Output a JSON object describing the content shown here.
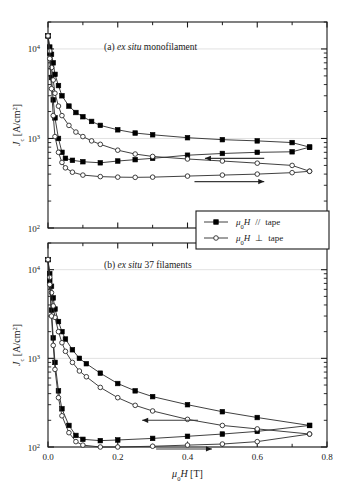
{
  "figure": {
    "xlabel_mu": "μ",
    "xlabel_sub": "0",
    "xlabel_H": "H",
    "xlabel_unit": " [T]",
    "ylabel_J": "J",
    "ylabel_sub": "c",
    "ylabel_unit": " [A/cm",
    "ylabel_sup": "2",
    "ylabel_close": "]",
    "xticks": [
      "0.0",
      "0.2",
      "0.4",
      "0.6",
      "0.8"
    ],
    "xtick_values": [
      0.0,
      0.2,
      0.4,
      0.6,
      0.8
    ],
    "xlim": [
      0.0,
      0.8
    ],
    "yticks_mantissa": [
      "10",
      "10",
      "10"
    ],
    "yticks_exponent": [
      "4",
      "3",
      "2"
    ],
    "ylim": [
      100,
      20000
    ],
    "panel_a_label_prefix": "(a) ",
    "panel_a_label_italic": "ex situ",
    "panel_a_label_suffix": " monofilament",
    "panel_b_label_prefix": "(b) ",
    "panel_b_label_italic": "ex situ",
    "panel_b_label_suffix": " 37 filaments"
  },
  "legend": {
    "entries": [
      {
        "marker": "filled-square",
        "mu": "μ",
        "sub": "0",
        "H": "H",
        "orient": "//",
        "tape": "tape"
      },
      {
        "marker": "open-circle",
        "mu": "μ",
        "sub": "0",
        "H": "H",
        "orient": "⊥",
        "tape": "tape"
      }
    ]
  },
  "colors": {
    "line": "#2b2b2b",
    "axis": "#1a1a1a",
    "grid": "#d9d9d9",
    "marker_fill": "#000000",
    "marker_open": "#ffffff",
    "background": "#ffffff"
  },
  "chart_data": {
    "type": "line",
    "title": "",
    "xlabel": "mu0 H [T]",
    "ylabel": "Jc [A/cm^2]",
    "xlim": [
      0.0,
      0.8
    ],
    "ylim": [
      100,
      20000
    ],
    "yscale": "log",
    "xscale": "linear",
    "grid": true,
    "legend_position": "inside-between-panels",
    "panels": [
      {
        "id": "a",
        "label": "(a) ex situ monofilament",
        "ylim": [
          100,
          20000
        ],
        "series": [
          {
            "name": "mu0H // tape, decreasing field (upper branch)",
            "marker": "filled-square",
            "branch": "decreasing",
            "x": [
              0.0,
              0.005,
              0.01,
              0.015,
              0.02,
              0.03,
              0.04,
              0.06,
              0.08,
              0.1,
              0.125,
              0.15,
              0.2,
              0.25,
              0.3,
              0.4,
              0.5,
              0.6,
              0.7,
              0.75
            ],
            "y": [
              14000,
              10500,
              8700,
              7000,
              5200,
              3900,
              3000,
              2300,
              1950,
              1750,
              1550,
              1400,
              1250,
              1150,
              1100,
              1020,
              970,
              940,
              900,
              800
            ]
          },
          {
            "name": "mu0H // tape, increasing field (lower branch)",
            "marker": "filled-square",
            "branch": "increasing",
            "x": [
              0.0,
              0.005,
              0.01,
              0.015,
              0.02,
              0.03,
              0.04,
              0.05,
              0.07,
              0.1,
              0.15,
              0.2,
              0.25,
              0.3,
              0.4,
              0.5,
              0.6,
              0.7,
              0.75
            ],
            "y": [
              14000,
              9000,
              4800,
              2700,
              1700,
              1000,
              700,
              600,
              570,
              550,
              535,
              560,
              580,
              600,
              650,
              680,
              700,
              710,
              800
            ]
          },
          {
            "name": "mu0H perp tape, decreasing field (upper branch)",
            "marker": "open-circle",
            "branch": "decreasing",
            "x": [
              0.0,
              0.005,
              0.01,
              0.015,
              0.02,
              0.03,
              0.04,
              0.06,
              0.08,
              0.1,
              0.125,
              0.15,
              0.2,
              0.25,
              0.3,
              0.4,
              0.5,
              0.6,
              0.7,
              0.75
            ],
            "y": [
              14000,
              9500,
              6200,
              4500,
              3200,
              2300,
              1800,
              1400,
              1180,
              1050,
              940,
              860,
              740,
              670,
              630,
              590,
              560,
              530,
              500,
              430
            ]
          },
          {
            "name": "mu0H perp tape, increasing field (lower branch)",
            "marker": "open-circle",
            "branch": "increasing",
            "x": [
              0.0,
              0.005,
              0.01,
              0.015,
              0.02,
              0.03,
              0.04,
              0.05,
              0.07,
              0.1,
              0.15,
              0.2,
              0.25,
              0.3,
              0.4,
              0.5,
              0.6,
              0.7,
              0.75
            ],
            "y": [
              14000,
              7800,
              3600,
              1800,
              1050,
              700,
              540,
              470,
              420,
              390,
              375,
              370,
              368,
              370,
              380,
              390,
              400,
              415,
              430
            ]
          }
        ],
        "annotations": [
          {
            "type": "arrow",
            "direction": "left",
            "x_from": 0.62,
            "x_to": 0.45,
            "y": 600
          },
          {
            "type": "arrow",
            "direction": "right",
            "x_from": 0.42,
            "x_to": 0.62,
            "y": 330
          }
        ]
      },
      {
        "id": "b",
        "label": "(b) ex situ 37 filaments",
        "ylim": [
          100,
          20000
        ],
        "series": [
          {
            "name": "mu0H // tape, decreasing field (upper branch)",
            "marker": "filled-square",
            "branch": "decreasing",
            "x": [
              0.0,
              0.005,
              0.01,
              0.015,
              0.02,
              0.03,
              0.04,
              0.05,
              0.07,
              0.09,
              0.11,
              0.15,
              0.2,
              0.25,
              0.3,
              0.4,
              0.5,
              0.6,
              0.75
            ],
            "y": [
              13000,
              9000,
              6500,
              4800,
              3600,
              2600,
              2000,
              1650,
              1250,
              1000,
              870,
              680,
              520,
              430,
              370,
              300,
              250,
              215,
              175
            ]
          },
          {
            "name": "mu0H // tape, increasing field (lower branch)",
            "marker": "filled-square",
            "branch": "increasing",
            "x": [
              0.0,
              0.005,
              0.01,
              0.015,
              0.02,
              0.03,
              0.04,
              0.06,
              0.08,
              0.1,
              0.15,
              0.2,
              0.3,
              0.4,
              0.5,
              0.6,
              0.75
            ],
            "y": [
              13000,
              7500,
              3500,
              1700,
              900,
              430,
              270,
              175,
              135,
              122,
              118,
              120,
              125,
              132,
              140,
              150,
              175
            ]
          },
          {
            "name": "mu0H perp tape, decreasing field (upper branch)",
            "marker": "open-circle",
            "branch": "decreasing",
            "x": [
              0.0,
              0.005,
              0.01,
              0.015,
              0.02,
              0.03,
              0.04,
              0.05,
              0.07,
              0.09,
              0.11,
              0.15,
              0.2,
              0.25,
              0.3,
              0.4,
              0.5,
              0.6,
              0.75
            ],
            "y": [
              13000,
              8200,
              5500,
              3900,
              2900,
              2000,
              1500,
              1200,
              900,
              720,
              620,
              470,
              360,
              295,
              255,
              205,
              175,
              160,
              140
            ]
          },
          {
            "name": "mu0H perp tape, increasing field (lower branch)",
            "marker": "open-circle",
            "branch": "increasing",
            "x": [
              0.0,
              0.005,
              0.01,
              0.015,
              0.02,
              0.03,
              0.04,
              0.06,
              0.08,
              0.1,
              0.15,
              0.2,
              0.3,
              0.4,
              0.5,
              0.6,
              0.75
            ],
            "y": [
              13000,
              6800,
              3000,
              1400,
              750,
              360,
              225,
              145,
              115,
              105,
              100,
              100,
              102,
              105,
              108,
              115,
              140
            ]
          }
        ],
        "annotations": [
          {
            "type": "arrow",
            "direction": "left",
            "x_from": 0.43,
            "x_to": 0.27,
            "y": 200
          },
          {
            "type": "arrow",
            "direction": "right",
            "x_from": 0.31,
            "x_to": 0.47,
            "y": 95
          }
        ]
      }
    ]
  }
}
